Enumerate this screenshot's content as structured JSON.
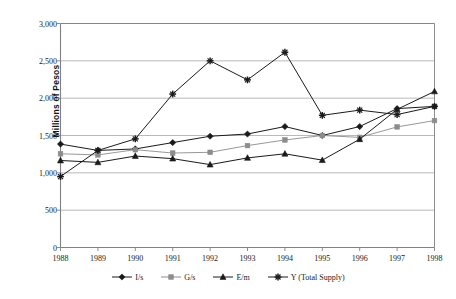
{
  "chart_data": {
    "type": "line",
    "title": "",
    "xlabel": "",
    "ylabel": "Millions of Pesos",
    "categories": [
      "1988",
      "1989",
      "1990",
      "1991",
      "1992",
      "1993",
      "1994",
      "1995",
      "1996",
      "1997",
      "1998"
    ],
    "x": [
      1988,
      1989,
      1990,
      1991,
      1992,
      1993,
      1994,
      1995,
      1996,
      1997,
      1998
    ],
    "ylim": [
      0,
      3000
    ],
    "yticks": [
      0,
      500,
      1000,
      1500,
      2000,
      2500,
      3000
    ],
    "ytick_labels": [
      "0",
      "500",
      "1,000",
      "1,500",
      "2,000",
      "2,500",
      "3,000"
    ],
    "grid": true,
    "grid_axis": "y",
    "legend_position": "bottom",
    "series": [
      {
        "name": "I/s",
        "marker": "diamond",
        "color": "#1a1a1a",
        "values": [
          1385,
          1300,
          1320,
          1405,
          1490,
          1520,
          1620,
          1500,
          1620,
          1860,
          1890
        ]
      },
      {
        "name": "G/s",
        "marker": "square",
        "color": "#8c8c8c",
        "values": [
          1255,
          1240,
          1310,
          1265,
          1275,
          1365,
          1440,
          1500,
          1475,
          1615,
          1700
        ]
      },
      {
        "name": "E/m",
        "marker": "triangle",
        "color": "#1a1a1a",
        "values": [
          1165,
          1140,
          1225,
          1190,
          1110,
          1200,
          1255,
          1170,
          1450,
          1850,
          2090
        ]
      },
      {
        "name": "Y (Total Supply)",
        "marker": "star",
        "color": "#1a1a1a",
        "values": [
          950,
          1300,
          1455,
          2055,
          2500,
          2245,
          2615,
          1770,
          1840,
          1780,
          1890
        ]
      }
    ]
  },
  "legend": {
    "entries": [
      {
        "label": "I/s"
      },
      {
        "label": "G/s"
      },
      {
        "label": "E/m"
      },
      {
        "label": "Y (Total Supply)"
      }
    ]
  },
  "axis": {
    "y_title": "Millions of Pesos"
  },
  "colors": {
    "axis": "#808080",
    "grid": "#a8a8a8",
    "dark_series": "#1a1a1a",
    "gray_series": "#8c8c8c",
    "background": "#ffffff"
  }
}
